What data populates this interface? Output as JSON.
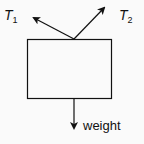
{
  "diagram": {
    "type": "free-body-diagram",
    "body": {
      "shape": "rectangle"
    },
    "forces": [
      {
        "id": "T1",
        "label_main": "T",
        "label_sub": "1",
        "direction": "up-left"
      },
      {
        "id": "T2",
        "label_main": "T",
        "label_sub": "2",
        "direction": "up-right"
      },
      {
        "id": "weight",
        "label": "weight",
        "direction": "down"
      }
    ],
    "colors": {
      "stroke": "#111111",
      "background": "#fafafa"
    }
  }
}
